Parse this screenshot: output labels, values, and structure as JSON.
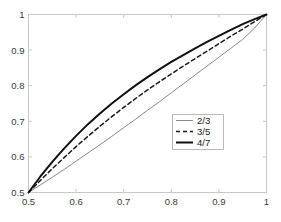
{
  "chart_data": {
    "type": "line",
    "title": "",
    "subtitle": "",
    "xlabel": "",
    "ylabel": "",
    "xlim": [
      0.5,
      1.0
    ],
    "ylim": [
      0.5,
      1.0
    ],
    "grid": false,
    "legend_position": "center-right",
    "xticks": [
      0.5,
      0.6,
      0.7,
      0.8,
      0.9,
      1.0
    ],
    "yticks": [
      0.5,
      0.6,
      0.7,
      0.8,
      0.9,
      1.0
    ],
    "xticklabels": [
      "0.5",
      "0.6",
      "0.7",
      "0.8",
      "0.9",
      "1"
    ],
    "yticklabels": [
      "0.5",
      "0.6",
      "0.7",
      "0.8",
      "0.9",
      "1"
    ],
    "x": [
      0.5,
      0.525,
      0.55,
      0.575,
      0.6,
      0.625,
      0.65,
      0.675,
      0.7,
      0.725,
      0.75,
      0.775,
      0.8,
      0.825,
      0.85,
      0.875,
      0.9,
      0.925,
      0.95,
      0.975,
      1.0
    ],
    "series": [
      {
        "name": "2/3",
        "label": "2/3",
        "style": "solid-thin",
        "color": "#7a7a7a",
        "width": 0.9,
        "dash": "none",
        "values": [
          0.5,
          0.521,
          0.543,
          0.565,
          0.588,
          0.611,
          0.634,
          0.658,
          0.682,
          0.706,
          0.731,
          0.755,
          0.78,
          0.805,
          0.83,
          0.855,
          0.88,
          0.905,
          0.93,
          0.962,
          1.0
        ]
      },
      {
        "name": "3/5",
        "label": "3/5",
        "style": "dashed",
        "color": "#1a1a1a",
        "width": 1.5,
        "dash": "4,3",
        "values": [
          0.5,
          0.534,
          0.567,
          0.598,
          0.629,
          0.658,
          0.686,
          0.713,
          0.739,
          0.764,
          0.788,
          0.811,
          0.833,
          0.855,
          0.876,
          0.897,
          0.918,
          0.939,
          0.959,
          0.98,
          1.0
        ]
      },
      {
        "name": "4/7",
        "label": "4/7",
        "style": "solid-thick",
        "color": "#111111",
        "width": 2.0,
        "dash": "none",
        "values": [
          0.5,
          0.545,
          0.586,
          0.624,
          0.659,
          0.692,
          0.722,
          0.75,
          0.776,
          0.801,
          0.824,
          0.846,
          0.867,
          0.886,
          0.905,
          0.923,
          0.94,
          0.957,
          0.973,
          0.987,
          1.0
        ]
      }
    ],
    "legend": {
      "entries": [
        "2/3",
        "3/5",
        "4/7"
      ]
    },
    "colors": {
      "axis": "#c9c9c9",
      "legend_border": "#b8b8b8",
      "background": "#ffffff",
      "tick_text": "#3a3a3a"
    }
  }
}
